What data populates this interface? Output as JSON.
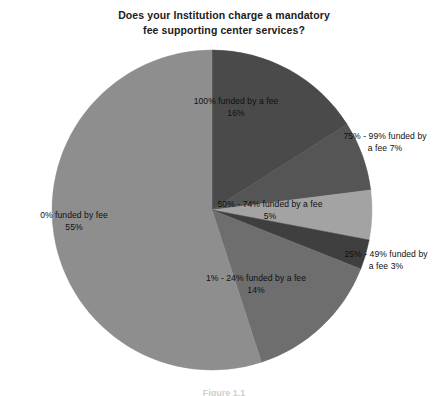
{
  "chart_data": {
    "type": "pie",
    "title": "Does your Institution charge a mandatory fee supporting center services?",
    "title_lines": [
      "Does your Institution charge a mandatory",
      "fee supporting center services?"
    ],
    "xlabel": "",
    "ylabel": "",
    "legend": "none",
    "grid": false,
    "units": "percent",
    "start_angle_deg": 0,
    "direction": "clockwise",
    "categories": [
      "100% funded by a fee",
      "75% - 99% funded by a fee",
      "50% - 74% funded by a fee",
      "25% - 49% funded by a fee",
      "1% - 24% funded by a fee",
      "0% funded by fee"
    ],
    "values": [
      16,
      7,
      5,
      3,
      14,
      55
    ],
    "colors": [
      "#4a4a4a",
      "#555555",
      "#a3a3a3",
      "#3f3f3f",
      "#6e6e6e",
      "#8e8e8e"
    ],
    "slices": [
      {
        "name": "100% funded by a fee",
        "label_text": "100% funded by a fee",
        "label_pct": "16%",
        "value": 16,
        "color": "#4a4a4a",
        "label_position": "inside"
      },
      {
        "name": "75% - 99% funded by a fee",
        "label_text": "75% - 99% funded by",
        "label_pct": "a fee 7%",
        "value": 7,
        "color": "#555555",
        "label_position": "outside"
      },
      {
        "name": "50% - 74% funded by a fee",
        "label_text": "50% - 74% funded by a fee",
        "label_pct": "5%",
        "value": 5,
        "color": "#a3a3a3",
        "label_position": "inside"
      },
      {
        "name": "25% - 49% funded by a fee",
        "label_text": "25% - 49% funded by",
        "label_pct": "a fee 3%",
        "value": 3,
        "color": "#3f3f3f",
        "label_position": "outside"
      },
      {
        "name": "1% - 24% funded by a fee",
        "label_text": "1% - 24% funded by a fee",
        "label_pct": "14%",
        "value": 14,
        "color": "#6e6e6e",
        "label_position": "inside"
      },
      {
        "name": "0% funded by fee",
        "label_text": "0% funded by fee",
        "label_pct": "55%",
        "value": 55,
        "color": "#8e8e8e",
        "label_position": "inside"
      }
    ]
  },
  "caption": {
    "text": "Figure 1.1"
  }
}
